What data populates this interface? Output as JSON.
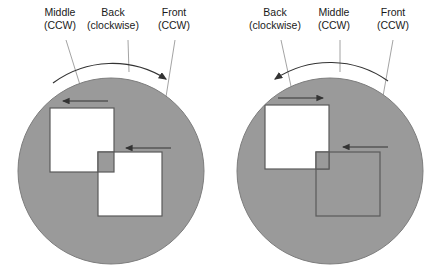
{
  "figure": {
    "background_color": "#ffffff",
    "disc_fill": "#9a9a9a",
    "outline_color": "#4d4d4d",
    "square_fill_white": "#ffffff",
    "leader_line_color": "#8c8c8c",
    "arrow_color": "#333333",
    "text_color": "#1a1a1a"
  },
  "panels": [
    {
      "id": "left-panel",
      "name": "left-diagram",
      "disc": {
        "cx": 111,
        "cy": 171,
        "r": 93
      },
      "arc_arrow": {
        "direction": "clockwise",
        "arrowhead_side": "right"
      },
      "labels": [
        {
          "key": "middle",
          "line1": "Middle",
          "line2": "(CCW)",
          "x": 60,
          "y": 16
        },
        {
          "key": "back",
          "line1": "Back",
          "line2": "(clockwise)",
          "x": 113,
          "y": 16
        },
        {
          "key": "front",
          "line1": "Front",
          "line2": "(CCW)",
          "x": 172,
          "y": 16
        }
      ],
      "squares": [
        {
          "key": "back-square",
          "x": 50,
          "y": 108,
          "size": 64,
          "fill": "#ffffff",
          "arrow": "left"
        },
        {
          "key": "front-square",
          "x": 98,
          "y": 152,
          "size": 64,
          "fill": "#ffffff",
          "arrow": "left"
        }
      ],
      "inner_arrows": [
        {
          "key": "back-arrow",
          "direction": "left",
          "x1": 108,
          "y1": 101,
          "x2": 63,
          "y2": 101
        },
        {
          "key": "front-arrow",
          "direction": "left",
          "x1": 171,
          "y1": 148,
          "x2": 126,
          "y2": 148
        }
      ]
    },
    {
      "id": "right-panel",
      "name": "right-diagram",
      "disc": {
        "cx": 330,
        "cy": 171,
        "r": 93
      },
      "arc_arrow": {
        "direction": "counter-clockwise",
        "arrowhead_side": "left"
      },
      "labels": [
        {
          "key": "back",
          "line1": "Back",
          "line2": "(clockwise)",
          "x": 275,
          "y": 16
        },
        {
          "key": "middle",
          "line1": "Middle",
          "line2": "(CCW)",
          "x": 332,
          "y": 16
        },
        {
          "key": "front",
          "line1": "Front",
          "line2": "(CCW)",
          "x": 392,
          "y": 16
        }
      ],
      "squares": [
        {
          "key": "back-square",
          "x": 265,
          "y": 105,
          "size": 64,
          "fill": "#ffffff",
          "arrow": "right"
        },
        {
          "key": "front-square",
          "x": 316,
          "y": 152,
          "size": 64,
          "fill": "none",
          "arrow": "left"
        }
      ],
      "inner_arrows": [
        {
          "key": "back-arrow",
          "direction": "right",
          "x1": 278,
          "y1": 98,
          "x2": 323,
          "y2": 98
        },
        {
          "key": "front-arrow",
          "direction": "left",
          "x1": 388,
          "y1": 147,
          "x2": 343,
          "y2": 147
        }
      ]
    }
  ]
}
